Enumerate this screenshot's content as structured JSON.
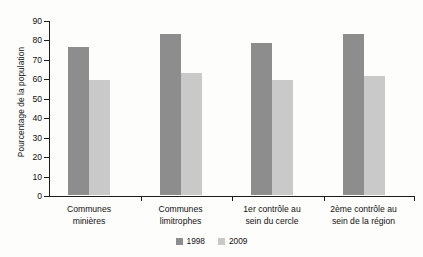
{
  "chart_data": {
    "type": "bar",
    "title": "",
    "subtitle": "",
    "xlabel": "",
    "ylabel": "Pourcentage de la population",
    "ylim": [
      0,
      90
    ],
    "yticks": [
      0,
      10,
      20,
      30,
      40,
      50,
      60,
      70,
      80,
      90
    ],
    "grid": false,
    "legend_position": "bottom-center",
    "categories": [
      "Communes\nminières",
      "Communes\nlimitrophes",
      "1er contrôle au\nsein du cercle",
      "2ème contrôle au\nsein de la région"
    ],
    "category_lines": [
      [
        "Communes",
        "minières"
      ],
      [
        "Communes",
        "limitrophes"
      ],
      [
        "1er contrôle au",
        "sein du cercle"
      ],
      [
        "2ème contrôle au",
        "sein de la région"
      ]
    ],
    "series": [
      {
        "name": "1998",
        "color": "#8d8d8d",
        "values": [
          76,
          83,
          78,
          83
        ]
      },
      {
        "name": "2009",
        "color": "#c9c9c9",
        "values": [
          59,
          63,
          59,
          61
        ]
      }
    ]
  },
  "axis": {
    "y_title": "Pourcentage de la population",
    "y_labels": [
      "90",
      "80",
      "70",
      "60",
      "50",
      "40",
      "30",
      "20",
      "10",
      "0"
    ]
  },
  "legend": {
    "items": [
      {
        "label": "1998",
        "color": "#8d8d8d"
      },
      {
        "label": "2009",
        "color": "#c9c9c9"
      }
    ]
  }
}
